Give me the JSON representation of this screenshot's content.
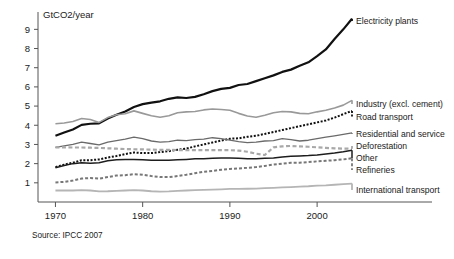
{
  "chart_data": {
    "type": "line",
    "title": "",
    "ylabel": "GtCO2/year",
    "xlabel": "",
    "source": "Source: IPCC 2007",
    "xlim": [
      1968,
      2004
    ],
    "ylim": [
      0,
      9.8
    ],
    "xticks": [
      1970,
      1980,
      1990,
      2000
    ],
    "xtick_labels": [
      "1970",
      "1980",
      "1990",
      "2000"
    ],
    "yticks": [
      1,
      2,
      3,
      4,
      5,
      6,
      7,
      8,
      9
    ],
    "ytick_labels": [
      "1",
      "2",
      "3",
      "4",
      "5",
      "6",
      "7",
      "8",
      "9"
    ],
    "grid": false,
    "legend_position": "right-inline",
    "x": [
      1970,
      1971,
      1972,
      1973,
      1974,
      1975,
      1976,
      1977,
      1978,
      1979,
      1980,
      1981,
      1982,
      1983,
      1984,
      1985,
      1986,
      1987,
      1988,
      1989,
      1990,
      1991,
      1992,
      1993,
      1994,
      1995,
      1996,
      1997,
      1998,
      1999,
      2000,
      2001,
      2002,
      2003,
      2004
    ],
    "series": [
      {
        "name": "Electricity plants",
        "label": "Electricity plants",
        "color": "#111111",
        "width": 2.2,
        "dash": "none",
        "values": [
          3.45,
          3.62,
          3.78,
          4.02,
          4.08,
          4.1,
          4.35,
          4.55,
          4.72,
          4.95,
          5.1,
          5.18,
          5.25,
          5.38,
          5.45,
          5.42,
          5.48,
          5.62,
          5.78,
          5.9,
          5.95,
          6.1,
          6.15,
          6.3,
          6.45,
          6.6,
          6.78,
          6.9,
          7.1,
          7.28,
          7.6,
          7.95,
          8.5,
          9.0,
          9.55
        ]
      },
      {
        "name": "Industry (excl. cement)",
        "label": "Industry (excl. cement)",
        "color": "#999999",
        "width": 1.6,
        "dash": "none",
        "values": [
          4.08,
          4.12,
          4.2,
          4.35,
          4.3,
          4.15,
          4.4,
          4.55,
          4.6,
          4.75,
          4.62,
          4.5,
          4.42,
          4.5,
          4.65,
          4.7,
          4.72,
          4.8,
          4.85,
          4.82,
          4.78,
          4.62,
          4.48,
          4.42,
          4.52,
          4.65,
          4.72,
          4.7,
          4.62,
          4.6,
          4.7,
          4.78,
          4.9,
          5.05,
          5.3
        ]
      },
      {
        "name": "Road transport",
        "label": "Road transport",
        "color": "#111111",
        "width": 2.0,
        "dash": "2,1.6",
        "values": [
          1.82,
          1.95,
          2.05,
          2.18,
          2.18,
          2.22,
          2.32,
          2.4,
          2.5,
          2.58,
          2.55,
          2.55,
          2.6,
          2.65,
          2.72,
          2.78,
          2.9,
          3.0,
          3.1,
          3.2,
          3.3,
          3.32,
          3.4,
          3.45,
          3.55,
          3.65,
          3.75,
          3.85,
          3.95,
          4.05,
          4.15,
          4.25,
          4.4,
          4.58,
          4.75
        ]
      },
      {
        "name": "Residential and service",
        "label": "Residential and service",
        "color": "#6a6a6a",
        "width": 1.3,
        "dash": "none",
        "values": [
          2.85,
          2.92,
          3.0,
          3.12,
          3.05,
          2.98,
          3.12,
          3.2,
          3.28,
          3.38,
          3.3,
          3.18,
          3.12,
          3.15,
          3.22,
          3.2,
          3.25,
          3.28,
          3.35,
          3.3,
          3.22,
          3.15,
          3.1,
          3.12,
          3.18,
          3.2,
          3.3,
          3.25,
          3.18,
          3.22,
          3.3,
          3.38,
          3.45,
          3.52,
          3.6
        ]
      },
      {
        "name": "Deforestation",
        "label": "Deforestation",
        "color": "#a8a8a8",
        "width": 2.2,
        "dash": "4,2.5",
        "values": [
          2.85,
          2.85,
          2.84,
          2.84,
          2.83,
          2.82,
          2.8,
          2.78,
          2.76,
          2.75,
          2.74,
          2.73,
          2.72,
          2.72,
          2.71,
          2.7,
          2.7,
          2.7,
          2.7,
          2.7,
          2.7,
          2.68,
          2.62,
          2.52,
          2.45,
          2.85,
          2.9,
          2.92,
          2.9,
          2.88,
          2.85,
          2.82,
          2.8,
          2.78,
          2.78
        ]
      },
      {
        "name": "Other",
        "label": "Other",
        "color": "#1d1d1d",
        "width": 1.5,
        "dash": "none",
        "values": [
          1.78,
          1.9,
          2.0,
          2.05,
          2.02,
          2.05,
          2.15,
          2.2,
          2.22,
          2.22,
          2.2,
          2.18,
          2.18,
          2.18,
          2.2,
          2.22,
          2.25,
          2.25,
          2.28,
          2.3,
          2.3,
          2.28,
          2.25,
          2.25,
          2.28,
          2.3,
          2.35,
          2.38,
          2.4,
          2.42,
          2.45,
          2.5,
          2.55,
          2.62,
          2.7
        ]
      },
      {
        "name": "Refineries",
        "label": "Refineries",
        "color": "#777777",
        "width": 2.0,
        "dash": "3,2",
        "values": [
          1.02,
          1.05,
          1.12,
          1.22,
          1.25,
          1.22,
          1.3,
          1.38,
          1.4,
          1.45,
          1.42,
          1.35,
          1.3,
          1.3,
          1.35,
          1.42,
          1.5,
          1.58,
          1.62,
          1.68,
          1.72,
          1.75,
          1.78,
          1.82,
          1.88,
          1.95,
          2.0,
          2.05,
          2.05,
          2.08,
          2.12,
          2.15,
          2.18,
          2.22,
          2.28
        ]
      },
      {
        "name": "International transport",
        "label": "International transport",
        "color": "#b5b5b5",
        "width": 1.8,
        "dash": "none",
        "values": [
          0.6,
          0.6,
          0.6,
          0.62,
          0.6,
          0.55,
          0.56,
          0.58,
          0.6,
          0.62,
          0.6,
          0.56,
          0.54,
          0.55,
          0.58,
          0.6,
          0.62,
          0.63,
          0.64,
          0.66,
          0.68,
          0.68,
          0.69,
          0.7,
          0.72,
          0.74,
          0.76,
          0.78,
          0.8,
          0.82,
          0.85,
          0.87,
          0.9,
          0.93,
          0.96
        ]
      }
    ],
    "legend_entries": [
      {
        "label": "Electricity plants",
        "y": 21
      },
      {
        "label": "Industry (excl. cement)",
        "y": 104
      },
      {
        "label": "Road transport",
        "y": 117
      },
      {
        "label": "Residential and service",
        "y": 134
      },
      {
        "label": "Deforestation",
        "y": 146
      },
      {
        "label": "Other",
        "y": 158
      },
      {
        "label": "Refineries",
        "y": 170
      },
      {
        "label": "International transport",
        "y": 190
      }
    ]
  }
}
